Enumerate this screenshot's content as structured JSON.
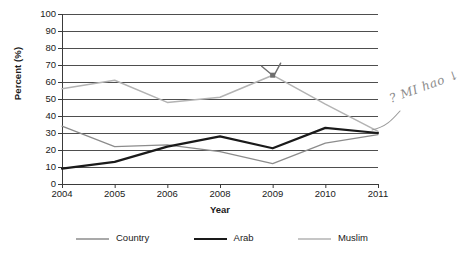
{
  "chart_data": {
    "type": "line",
    "title": "",
    "xlabel": "Year",
    "ylabel": "Percent (%)",
    "categories": [
      "2004",
      "2005",
      "2006",
      "2008",
      "2009",
      "2010",
      "2011"
    ],
    "ylim": [
      0,
      100
    ],
    "ytick_step": 10,
    "yticks": [
      "0",
      "10",
      "20",
      "30",
      "40",
      "50",
      "60",
      "70",
      "80",
      "90",
      "100"
    ],
    "grid": "horizontal",
    "legend_position": "bottom",
    "series": [
      {
        "name": "Country",
        "color": "#8c8c8c",
        "width": 1.3,
        "values": [
          34,
          22,
          23,
          19,
          12,
          24,
          29
        ]
      },
      {
        "name": "Arab",
        "color": "#1a1a1a",
        "width": 2.2,
        "values": [
          9,
          13,
          22,
          28,
          21,
          33,
          30
        ]
      },
      {
        "name": "Muslim",
        "color": "#b3b3b3",
        "width": 1.5,
        "values": [
          56,
          61,
          48,
          51,
          64,
          47,
          31
        ]
      }
    ],
    "annotations": [
      {
        "name": "handwritten-note",
        "text": "? MI hao",
        "arrow": "↓"
      },
      {
        "name": "handwritten-checkmark",
        "text": "",
        "target_series": "Muslim",
        "target_category": "2009",
        "target_value": 64
      }
    ]
  },
  "axes": {
    "x_title": "Year",
    "y_title": "Percent (%)"
  }
}
